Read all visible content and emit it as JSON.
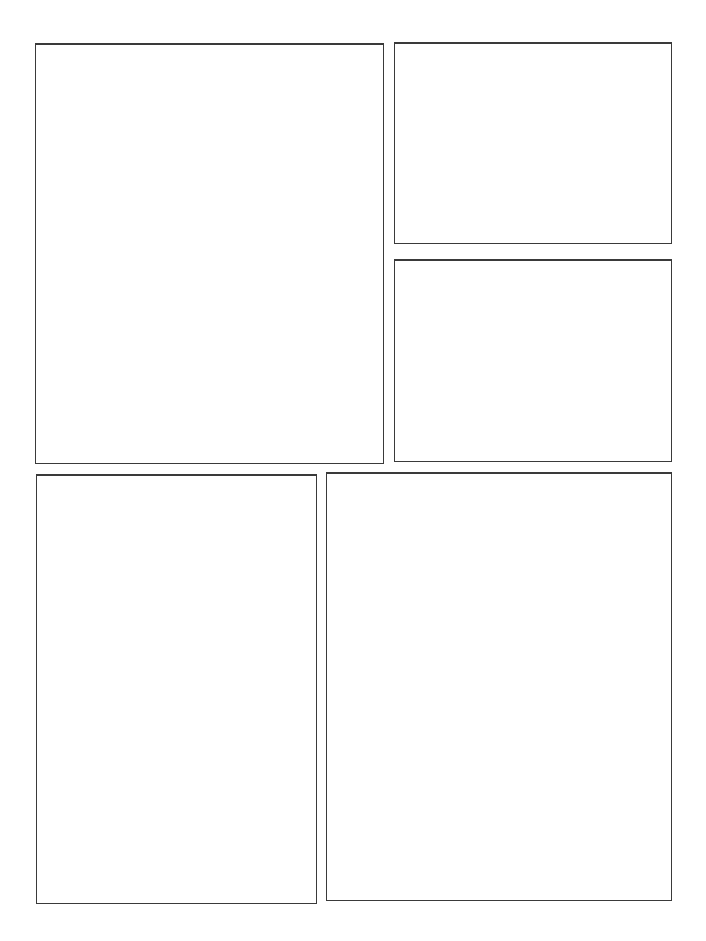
{
  "page": {
    "type": "comic-panel-template",
    "background": "#ffffff",
    "border_color": "#3a3a3a",
    "panel_count": 5
  },
  "panels": [
    {
      "id": "panel-1",
      "x": 35,
      "y": 43,
      "w": 349,
      "h": 421
    },
    {
      "id": "panel-2",
      "x": 394,
      "y": 42,
      "w": 278,
      "h": 202
    },
    {
      "id": "panel-3",
      "x": 394,
      "y": 259,
      "w": 278,
      "h": 203
    },
    {
      "id": "panel-4",
      "x": 36,
      "y": 474,
      "w": 281,
      "h": 430
    },
    {
      "id": "panel-5",
      "x": 326,
      "y": 472,
      "w": 346,
      "h": 429
    }
  ]
}
